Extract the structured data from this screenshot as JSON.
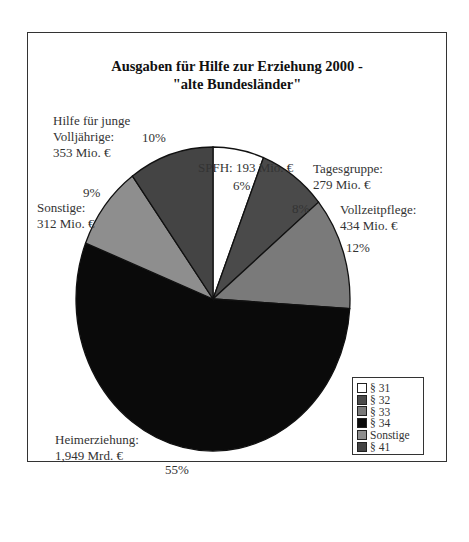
{
  "chart_data": {
    "type": "pie",
    "title": "Ausgaben für Hilfe zur Erziehung 2000 - \"alte Bundesländer\"",
    "title_lines": [
      "Ausgaben für Hilfe zur Erziehung 2000 -",
      "\"alte Bundesländer\""
    ],
    "categories": [
      "§ 31",
      "§ 32",
      "§ 33",
      "§ 34",
      "Sonstige",
      "§ 41"
    ],
    "values": [
      6,
      8,
      12,
      55,
      9,
      10
    ],
    "unit": "%",
    "slices": [
      {
        "legend": "§ 31",
        "name": "SPFH",
        "amount": "193 Mio. €",
        "percent": "6%",
        "color": "#ffffff"
      },
      {
        "legend": "§ 32",
        "name": "Tagesgruppe",
        "amount": "279 Mio. €",
        "percent": "8%",
        "color": "#4a4a4a"
      },
      {
        "legend": "§ 33",
        "name": "Vollzeitpflege",
        "amount": "434 Mio. €",
        "percent": "12%",
        "color": "#7a7a7a"
      },
      {
        "legend": "§ 34",
        "name": "Heimerziehung",
        "amount": "1,949 Mrd. €",
        "percent": "55%",
        "color": "#0a0a0a"
      },
      {
        "legend": "Sonstige",
        "name": "Sonstige",
        "amount": "312 Mio. €",
        "percent": "9%",
        "color": "#8e8e8e"
      },
      {
        "legend": "§ 41",
        "name": "Hilfe für junge Volljährige",
        "amount": "353 Mio. €",
        "percent": "10%",
        "color": "#444444"
      }
    ],
    "legend_position": "bottom-right",
    "start_angle": "12 o'clock, clockwise"
  },
  "labels": {
    "spfh": {
      "line1": "SPFH: 193 Mio. €",
      "pct": "6%"
    },
    "tagesgruppe": {
      "line1": "Tagesgruppe:",
      "line2": "279 Mio. €",
      "pct": "8%"
    },
    "vollzeitpflege": {
      "line1": "Vollzeitpflege:",
      "line2": "434 Mio. €",
      "pct": "12%"
    },
    "heimerziehung": {
      "line1": "Heimerziehung:",
      "line2": "1,949 Mrd. €",
      "pct": "55%"
    },
    "sonstige": {
      "line1": "Sonstige:",
      "line2": "312 Mio. €",
      "pct": "9%"
    },
    "volljaehrige": {
      "line1": "Hilfe für junge",
      "line2": "Volljährige:",
      "line3": "353 Mio. €",
      "pct": "10%"
    }
  },
  "legend": {
    "items": [
      {
        "label": "§ 31",
        "color": "#ffffff"
      },
      {
        "label": "§ 32",
        "color": "#4a4a4a"
      },
      {
        "label": "§ 33",
        "color": "#7a7a7a"
      },
      {
        "label": "§ 34",
        "color": "#0a0a0a"
      },
      {
        "label": "Sonstige",
        "color": "#8e8e8e"
      },
      {
        "label": "§ 41",
        "color": "#444444"
      }
    ]
  }
}
